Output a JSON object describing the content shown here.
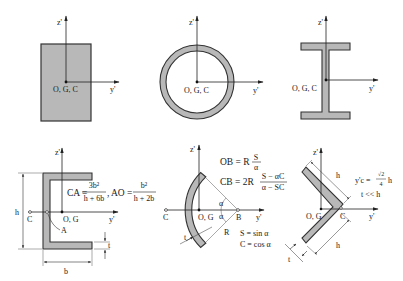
{
  "colors": {
    "fill": "#b8b8b8",
    "stroke": "#333333",
    "thin": "#555555",
    "background": "#ffffff"
  },
  "axes": {
    "z_label": "z'",
    "y_label": "y'"
  },
  "panels": {
    "rectangle": {
      "origin_label": "O, G, C"
    },
    "ring": {
      "origin_label": "O, G, C"
    },
    "i_beam": {
      "origin_label": "O, G, C"
    },
    "channel": {
      "origin_label": "O, G",
      "shear_center_label": "C",
      "point_a_label": "A",
      "dim_h": "h",
      "dim_b": "b",
      "dim_t": "t",
      "formula_ca_lhs": "CA =",
      "formula_ca_num": "3b²",
      "formula_ca_den": "h + 6b",
      "formula_sep": ",",
      "formula_ao_lhs": "AO =",
      "formula_ao_num": "b²",
      "formula_ao_den": "h + 2b"
    },
    "arc": {
      "origin_label": "O, G",
      "shear_center_label": "C",
      "point_b_label": "B",
      "angle_label": "α",
      "radius_label": "R",
      "dim_t": "t",
      "formula_ob_lhs": "OB = R",
      "formula_ob_num": "S",
      "formula_ob_den": "α",
      "formula_cb_lhs": "CB = 2R",
      "formula_cb_num": "S − αC",
      "formula_cb_den": "α − SC",
      "def_s": "S = sin α",
      "def_c": "C = cos α"
    },
    "angle": {
      "origin_label": "O, G",
      "shear_center_label": "C",
      "dim_h_top": "h",
      "dim_h_bottom": "h",
      "dim_t": "t",
      "formula_lhs": "y'c =",
      "formula_num": "√2",
      "formula_den": "4",
      "formula_rhs": "h",
      "condition": "t << h"
    }
  }
}
